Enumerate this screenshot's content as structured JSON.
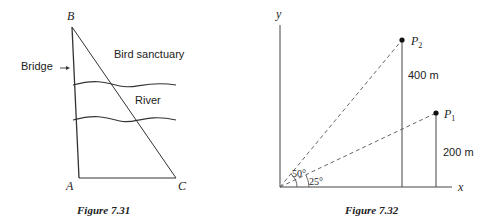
{
  "figure_731": {
    "caption": "Figure 7.31",
    "points": {
      "A": "A",
      "B": "B",
      "C": "C"
    },
    "labels": {
      "bridge": "Bridge",
      "bird_sanctuary": "Bird sanctuary",
      "river": "River"
    }
  },
  "figure_732": {
    "caption": "Figure 7.32",
    "axes": {
      "x": "x",
      "y": "y"
    },
    "points": {
      "p1": "P",
      "p1_sub": "1",
      "p2": "P",
      "p2_sub": "2"
    },
    "heights": {
      "p1": "200 m",
      "p2": "400 m"
    },
    "angles": {
      "p1": "25°",
      "p2": "50°"
    }
  }
}
